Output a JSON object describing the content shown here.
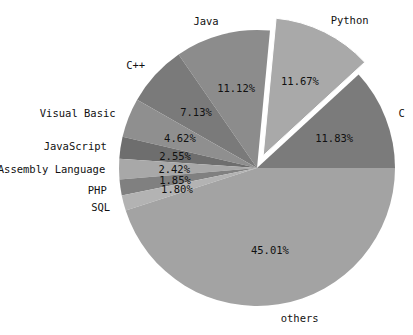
{
  "chart_data": {
    "type": "pie",
    "title": "",
    "start_angle_deg": 0,
    "counterclockwise": true,
    "slices": [
      {
        "label": "C",
        "value": 11.83,
        "pct_text": "11.83%",
        "color": "#7b7b7b",
        "explode": 0
      },
      {
        "label": "Python",
        "value": 11.67,
        "pct_text": "11.67%",
        "color": "#a9a9a9",
        "explode": 0.1
      },
      {
        "label": "Java",
        "value": 11.12,
        "pct_text": "11.12%",
        "color": "#8c8c8c",
        "explode": 0
      },
      {
        "label": "C++",
        "value": 7.13,
        "pct_text": "7.13%",
        "color": "#7a7a7a",
        "explode": 0
      },
      {
        "label": "Visual Basic",
        "value": 4.62,
        "pct_text": "4.62%",
        "color": "#8f8f8f",
        "explode": 0
      },
      {
        "label": "JavaScript",
        "value": 2.55,
        "pct_text": "2.55%",
        "color": "#6e6e6e",
        "explode": 0
      },
      {
        "label": "Assembly Language",
        "value": 2.42,
        "pct_text": "2.42%",
        "color": "#a8a8a8",
        "explode": 0
      },
      {
        "label": "PHP",
        "value": 1.85,
        "pct_text": "1.85%",
        "color": "#808080",
        "explode": 0
      },
      {
        "label": "SQL",
        "value": 1.8,
        "pct_text": "1.80%",
        "color": "#b3b3b3",
        "explode": 0
      },
      {
        "label": "others",
        "value": 45.01,
        "pct_text": "45.01%",
        "color": "#a3a3a3",
        "explode": 0
      }
    ],
    "legend": "none",
    "labels_outside": true,
    "pct_inside": true
  },
  "layout": {
    "cx": 257,
    "cy": 168,
    "r": 138,
    "label_dist": 1.1,
    "pct_dist": 0.6
  }
}
